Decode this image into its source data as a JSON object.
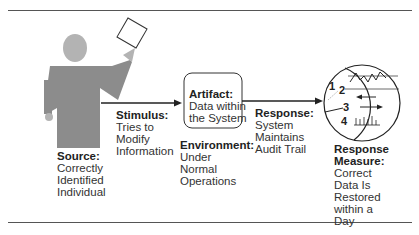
{
  "diagram": {
    "source": {
      "heading": "Source:",
      "lines": [
        "Correctly",
        "Identified",
        "Individual"
      ]
    },
    "stimulus": {
      "heading": "Stimulus:",
      "lines": [
        "Tries to",
        "Modify",
        "Information"
      ]
    },
    "artifact": {
      "heading": "Artifact:",
      "lines": [
        "Data within",
        "the System"
      ]
    },
    "environment": {
      "heading": "Environment:",
      "lines": [
        "Under",
        "Normal",
        "Operations"
      ]
    },
    "response": {
      "heading": "Response:",
      "lines": [
        "System",
        "Maintains",
        "Audit Trail"
      ]
    },
    "response_measure": {
      "heading_lines": [
        "Response",
        "Measure:"
      ],
      "lines": [
        "Correct",
        "Data Is",
        "Restored",
        "within a",
        "Day"
      ]
    },
    "gauge_numbers": [
      "1",
      "2",
      "3",
      "4"
    ],
    "colors": {
      "figure": "#8a8a8a",
      "head": "#b0b0b0",
      "line": "#222222"
    }
  }
}
